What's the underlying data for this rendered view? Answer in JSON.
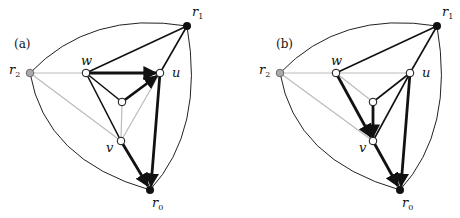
{
  "figure": {
    "panels": [
      {
        "id": "a",
        "label": "(a)",
        "nodes": {
          "r0": {
            "label": "r",
            "sub": "0",
            "fill": "#111111"
          },
          "r1": {
            "label": "r",
            "sub": "1",
            "fill": "#111111"
          },
          "r2": {
            "label": "r",
            "sub": "2",
            "fill": "#aaaaaa"
          },
          "w": {
            "label": "w",
            "fill": "#ffffff"
          },
          "u": {
            "label": "u",
            "fill": "#ffffff"
          },
          "v": {
            "label": "v",
            "fill": "#ffffff"
          },
          "c": {
            "label": "",
            "fill": "#ffffff"
          }
        },
        "directed_edges": [
          "w→u",
          "c→u",
          "u→r0",
          "v→r0"
        ],
        "black_edges": [
          "w-r1",
          "u-r1",
          "w-c",
          "w-v"
        ],
        "gray_edges": [
          "r2-w",
          "r2-v",
          "c-v",
          "v-u"
        ]
      },
      {
        "id": "b",
        "label": "(b)",
        "nodes": {
          "r0": {
            "label": "r",
            "sub": "0",
            "fill": "#111111"
          },
          "r1": {
            "label": "r",
            "sub": "1",
            "fill": "#111111"
          },
          "r2": {
            "label": "r",
            "sub": "2",
            "fill": "#aaaaaa"
          },
          "w": {
            "label": "w",
            "fill": "#ffffff"
          },
          "u": {
            "label": "u",
            "fill": "#ffffff"
          },
          "v": {
            "label": "v",
            "fill": "#ffffff"
          },
          "c": {
            "label": "",
            "fill": "#ffffff"
          }
        },
        "directed_edges": [
          "w→v",
          "c→v",
          "u→r0",
          "v→r0"
        ],
        "black_edges": [
          "w-r1",
          "u-r1",
          "u-c",
          "u-v"
        ],
        "gray_edges": [
          "r2-w",
          "r2-v",
          "w-u",
          "w-c"
        ]
      }
    ],
    "colors": {
      "edge": "#111111",
      "gray_edge": "#bbbbbb",
      "outer": "#222222"
    }
  }
}
